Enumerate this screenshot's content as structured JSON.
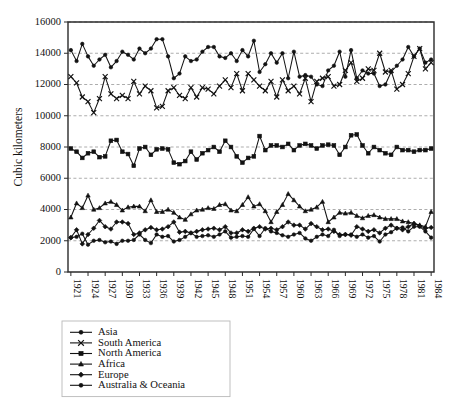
{
  "chart_data": {
    "type": "line",
    "title": "",
    "subtitle": "",
    "xlabel": "",
    "ylabel": "Cubic kilometers",
    "ylim": [
      0,
      16000
    ],
    "ytick_labels": [
      "0",
      "2000",
      "4000",
      "6000",
      "8000",
      "10000",
      "12000",
      "14000",
      "16000"
    ],
    "yticks": [
      0,
      2000,
      4000,
      6000,
      8000,
      10000,
      12000,
      14000,
      16000
    ],
    "grid": true,
    "grid_axis": "y",
    "legend_position": "below-left",
    "x_start": 1921,
    "x_end": 1984,
    "xtick_step": 3,
    "xtick_labels": [
      "1921",
      "1924",
      "1927",
      "1930",
      "1933",
      "1936",
      "1939",
      "1942",
      "1945",
      "1948",
      "1951",
      "1954",
      "1957",
      "1960",
      "1963",
      "1966",
      "1969",
      "1972",
      "1975",
      "1978",
      "1981",
      "1984"
    ],
    "x": [
      1921,
      1922,
      1923,
      1924,
      1925,
      1926,
      1927,
      1928,
      1929,
      1930,
      1931,
      1932,
      1933,
      1934,
      1935,
      1936,
      1937,
      1938,
      1939,
      1940,
      1941,
      1942,
      1943,
      1944,
      1945,
      1946,
      1947,
      1948,
      1949,
      1950,
      1951,
      1952,
      1953,
      1954,
      1955,
      1956,
      1957,
      1958,
      1959,
      1960,
      1961,
      1962,
      1963,
      1964,
      1965,
      1966,
      1967,
      1968,
      1969,
      1970,
      1971,
      1972,
      1973,
      1974,
      1975,
      1976,
      1977,
      1978,
      1979,
      1980,
      1981,
      1982,
      1983,
      1984
    ],
    "series": [
      {
        "name": "Asia",
        "marker": "circle",
        "values": [
          14200,
          13500,
          14600,
          13800,
          13200,
          13600,
          13900,
          13100,
          13500,
          14100,
          13900,
          13600,
          14300,
          14000,
          14300,
          14900,
          14900,
          13800,
          12400,
          12700,
          13800,
          13500,
          13600,
          14100,
          14400,
          14400,
          13800,
          13700,
          14000,
          13500,
          14200,
          13800,
          14800,
          12800,
          13300,
          14000,
          13400,
          14000,
          12400,
          14100,
          12500,
          12600,
          12500,
          12000,
          11900,
          12900,
          13200,
          14100,
          12500,
          14200,
          12400,
          12900,
          12700,
          12700,
          11900,
          12000,
          12800,
          13200,
          13600,
          14400,
          13800,
          14300,
          13400,
          13600
        ]
      },
      {
        "name": "South America",
        "marker": "x",
        "values": [
          12500,
          12100,
          11200,
          10900,
          10200,
          11100,
          12500,
          11400,
          11100,
          11300,
          11100,
          12200,
          11400,
          11900,
          11600,
          10500,
          10600,
          11600,
          11800,
          11300,
          11100,
          11800,
          11200,
          11800,
          11700,
          11400,
          11900,
          12300,
          11800,
          12700,
          11600,
          12700,
          12300,
          11900,
          11600,
          12200,
          11200,
          12300,
          11600,
          11900,
          11400,
          12400,
          10900,
          12200,
          12400,
          12500,
          11900,
          12000,
          12900,
          13400,
          12200,
          12400,
          13000,
          12900,
          14000,
          12800,
          12900,
          11700,
          12000,
          12700,
          13800,
          14300,
          13000,
          13400
        ]
      },
      {
        "name": "North America",
        "marker": "square",
        "values": [
          7900,
          7700,
          7300,
          7600,
          7700,
          7350,
          7400,
          8400,
          8450,
          7700,
          7550,
          6800,
          7900,
          8000,
          7500,
          7850,
          7900,
          7850,
          7000,
          6900,
          7100,
          7700,
          7200,
          7600,
          7800,
          8000,
          7700,
          8400,
          8000,
          7400,
          7000,
          7300,
          7400,
          8700,
          7800,
          8100,
          8100,
          8000,
          8200,
          7800,
          8100,
          8200,
          8100,
          7900,
          8100,
          8150,
          8100,
          7500,
          8000,
          8750,
          8800,
          8100,
          7600,
          8000,
          7800,
          7600,
          7500,
          8000,
          7800,
          7800,
          7700,
          7800,
          7800,
          7900
        ]
      },
      {
        "name": "Africa",
        "marker": "triangle",
        "values": [
          3500,
          4400,
          4100,
          4900,
          4000,
          4100,
          4400,
          4500,
          4300,
          3950,
          4150,
          4200,
          4200,
          3900,
          4600,
          3850,
          3850,
          4000,
          3800,
          3500,
          3350,
          3700,
          3950,
          4000,
          4100,
          4050,
          4300,
          4350,
          3950,
          3900,
          4300,
          4800,
          4200,
          4350,
          3900,
          3200,
          3850,
          4300,
          5000,
          4600,
          4200,
          3900,
          4000,
          4150,
          4500,
          3200,
          3500,
          3800,
          3750,
          3800,
          3600,
          3450,
          3600,
          3650,
          3500,
          3400,
          3400,
          3400,
          3250,
          3200,
          3100,
          3000,
          2900,
          3850
        ]
      },
      {
        "name": "Europe",
        "marker": "diamond",
        "values": [
          2200,
          2700,
          1800,
          2400,
          2800,
          3300,
          2900,
          2750,
          3200,
          3200,
          3100,
          2400,
          2500,
          2700,
          2850,
          2700,
          2750,
          2900,
          3200,
          2550,
          2600,
          2500,
          2600,
          2700,
          2750,
          2800,
          2700,
          2900,
          2500,
          2500,
          2700,
          2600,
          2800,
          2900,
          2750,
          2800,
          2700,
          2900,
          3200,
          3000,
          3000,
          2750,
          3100,
          2900,
          2700,
          2750,
          2600,
          2400,
          2400,
          2350,
          2900,
          2750,
          2600,
          2700,
          2500,
          2800,
          3000,
          2800,
          2700,
          2900,
          3100,
          2950,
          2800,
          2850
        ]
      },
      {
        "name": "Australia & Oceania",
        "marker": "circle",
        "values": [
          2200,
          2250,
          2450,
          1750,
          2000,
          2050,
          1900,
          1950,
          1800,
          2000,
          2000,
          2050,
          2400,
          2050,
          1850,
          2400,
          2250,
          2300,
          1950,
          2050,
          2250,
          2500,
          2250,
          2300,
          2350,
          2250,
          2400,
          2600,
          2200,
          2250,
          2300,
          2250,
          2750,
          2300,
          2800,
          2600,
          2500,
          2350,
          2250,
          2400,
          2500,
          2150,
          2000,
          2250,
          2400,
          2300,
          2700,
          2300,
          2400,
          2400,
          2250,
          2400,
          2200,
          2300,
          1950,
          2400,
          2550,
          2800,
          2850,
          2600,
          2900,
          2900,
          2600,
          2200
        ]
      }
    ]
  },
  "legend": {
    "items": [
      {
        "label": "Asia"
      },
      {
        "label": "South America"
      },
      {
        "label": "North America"
      },
      {
        "label": "Africa"
      },
      {
        "label": "Europe"
      },
      {
        "label": "Australia & Oceania"
      }
    ]
  },
  "colors": {
    "ink": "#121212",
    "grid": "#8a8a8a",
    "axis": "#2b2b2b",
    "background": "#ffffff"
  }
}
